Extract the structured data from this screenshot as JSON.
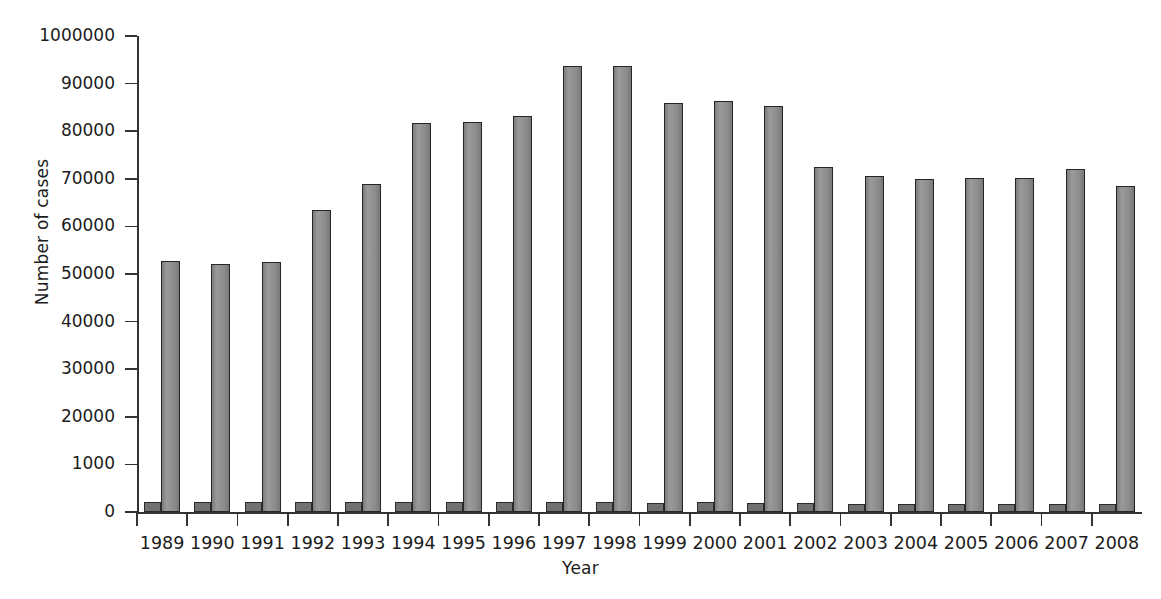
{
  "chart_data": {
    "type": "bar",
    "title": "",
    "xlabel": "Year",
    "ylabel": "Number of cases",
    "categories": [
      "1989",
      "1990",
      "1991",
      "1992",
      "1993",
      "1994",
      "1995",
      "1996",
      "1997",
      "1998",
      "1999",
      "2000",
      "2001",
      "2002",
      "2003",
      "2004",
      "2005",
      "2006",
      "2007",
      "2008"
    ],
    "values": [
      52700,
      52200,
      52600,
      63400,
      68900,
      81800,
      81900,
      83100,
      93800,
      93800,
      86000,
      86300,
      85200,
      72400,
      70600,
      70000,
      70100,
      70200,
      72000,
      68500
    ],
    "secondary_series": {
      "name": "baseline-stub",
      "values": [
        2100,
        2100,
        2100,
        2100,
        2100,
        2100,
        2000,
        2000,
        2000,
        2000,
        1900,
        2000,
        1800,
        1900,
        1700,
        1700,
        1700,
        1600,
        1600,
        1600
      ]
    },
    "ylim": [
      0,
      100000
    ],
    "ytick_values": [
      0,
      10000,
      20000,
      30000,
      40000,
      50000,
      60000,
      70000,
      80000,
      90000,
      100000
    ],
    "ytick_labels": [
      "0",
      "1000",
      "20000",
      "30000",
      "40000",
      "50000",
      "60000",
      "70000",
      "80000",
      "90000",
      "1000000"
    ],
    "grid": false,
    "legend": "none",
    "bar_color": "#8f8f8f",
    "bar_edge_color": "#262626",
    "axis_color": "#333333"
  }
}
